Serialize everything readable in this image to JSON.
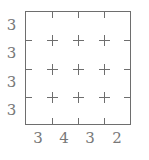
{
  "puzzle": {
    "type": "grid-clue-puzzle",
    "grid": {
      "rows": 4,
      "columns": 4,
      "line_color": "#6e6e6e",
      "background_color": "#ffffff",
      "intersection_marker": "plus-cross"
    },
    "row_clues": [
      {
        "index": 0,
        "value": "3"
      },
      {
        "index": 1,
        "value": "3"
      },
      {
        "index": 2,
        "value": "3"
      },
      {
        "index": 3,
        "value": "3"
      }
    ],
    "column_clues": [
      {
        "index": 0,
        "value": "3"
      },
      {
        "index": 1,
        "value": "4"
      },
      {
        "index": 2,
        "value": "3"
      },
      {
        "index": 3,
        "value": "2"
      }
    ],
    "clue_text_color": "#787878"
  }
}
